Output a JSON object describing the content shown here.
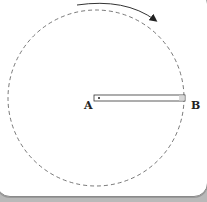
{
  "diagram": {
    "labels": {
      "pivot": "A",
      "end": "B"
    },
    "rotation_direction": "clockwise",
    "colors": {
      "stroke": "#333333",
      "dashed": "#555555",
      "background": "#ffffff",
      "frame": "#b9b9b9"
    }
  }
}
